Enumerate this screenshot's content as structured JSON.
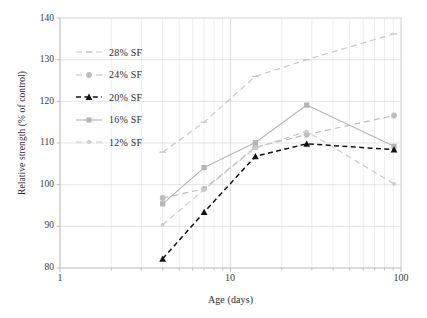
{
  "chart_data": {
    "type": "line",
    "title": "",
    "xlabel": "Age (days)",
    "ylabel": "Relative strength (% of control)",
    "xscale": "log",
    "xlim": [
      1,
      100
    ],
    "ylim": [
      80,
      140
    ],
    "yticks": [
      80,
      90,
      100,
      110,
      120,
      130,
      140
    ],
    "xticks": [
      1,
      10,
      100
    ],
    "xtick_labels": [
      "1",
      "10",
      "100"
    ],
    "grid": true,
    "legend_position": "upper-left-inside",
    "x": [
      4,
      7,
      14,
      28,
      91
    ],
    "series": [
      {
        "name": "28% SF",
        "values": [
          107.8,
          115.0,
          126.0,
          130.0,
          136.2
        ],
        "color": "#c9c9c9",
        "linestyle": "dashed",
        "marker": "dash"
      },
      {
        "name": "24% SF",
        "values": [
          96.8,
          99.0,
          109.0,
          112.0,
          116.6
        ],
        "color": "#bdbdbd",
        "linestyle": "dashed",
        "marker": "circle"
      },
      {
        "name": "20% SF",
        "values": [
          82.2,
          93.4,
          106.8,
          109.8,
          108.4
        ],
        "color": "#111111",
        "linestyle": "dashed",
        "marker": "triangle"
      },
      {
        "name": "16% SF",
        "values": [
          95.4,
          104.1,
          110.1,
          119.1,
          109.2
        ],
        "color": "#b5b5b5",
        "linestyle": "solid",
        "marker": "square"
      },
      {
        "name": "12% SF",
        "values": [
          90.4,
          98.8,
          108.8,
          112.8,
          100.2
        ],
        "color": "#cccccc",
        "linestyle": "dashed",
        "marker": "dot"
      }
    ]
  },
  "legend": {
    "items": [
      {
        "label": "28% SF"
      },
      {
        "label": "24% SF"
      },
      {
        "label": "20% SF"
      },
      {
        "label": "16% SF"
      },
      {
        "label": "12% SF"
      }
    ]
  },
  "axes": {
    "y_tick_labels": [
      "140",
      "130",
      "120",
      "110",
      "100",
      "90",
      "80"
    ],
    "x_tick_labels": [
      "1",
      "10",
      "100"
    ],
    "y_title": "Relative strength (% of control)",
    "x_title": "Age (days)"
  }
}
